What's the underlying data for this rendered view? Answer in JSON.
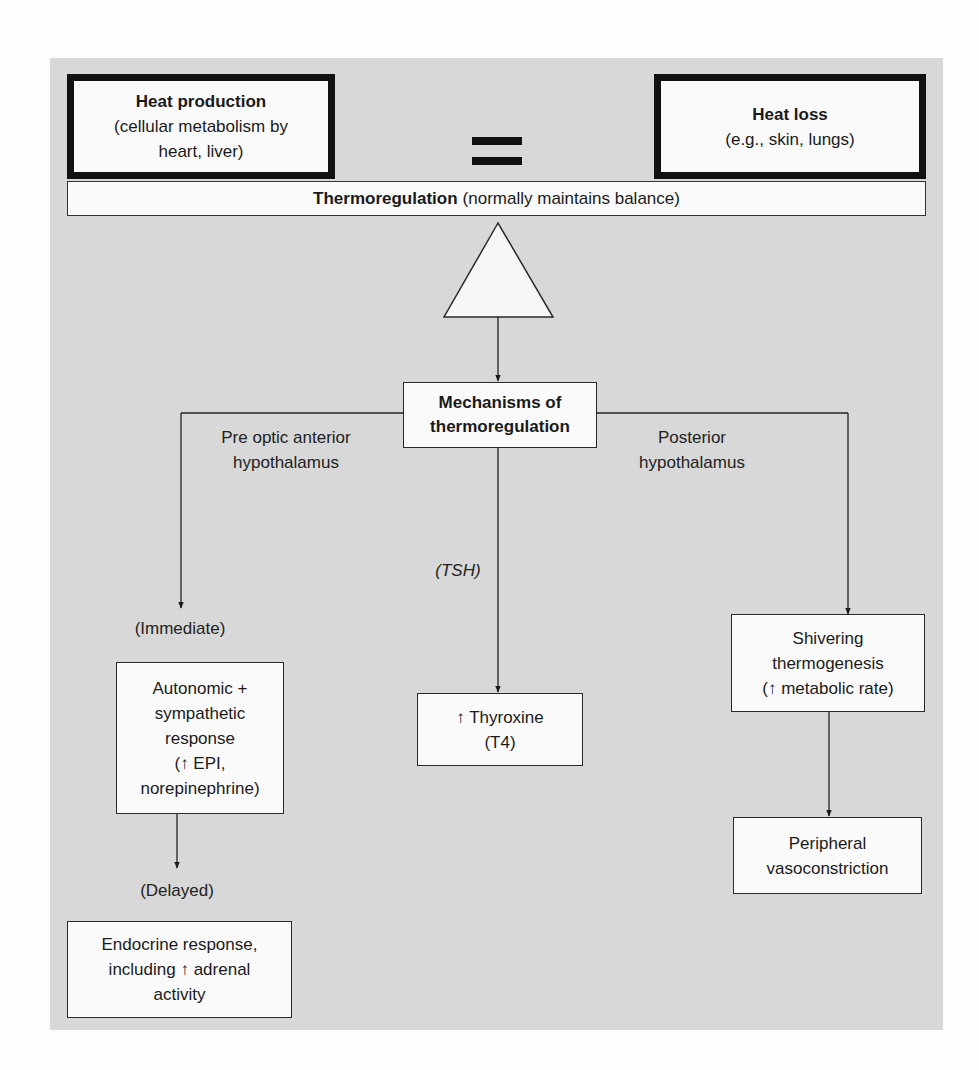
{
  "diagram": {
    "colors": {
      "panel_background": "#d8d8d8",
      "box_fill": "#fafafa",
      "line": "#222222"
    },
    "heat_production": {
      "title": "Heat production",
      "detail_line1": "(cellular metabolism by",
      "detail_line2": "heart, liver)"
    },
    "equals_symbol": "=",
    "heat_loss": {
      "title": "Heat loss",
      "detail": "(e.g., skin, lungs)"
    },
    "thermoregulation_bar": {
      "title": "Thermoregulation",
      "detail": "(normally maintains balance)"
    },
    "fulcrum": "triangle-fulcrum",
    "mechanisms": {
      "line1": "Mechanisms of",
      "line2": "thermoregulation"
    },
    "branches": {
      "left": {
        "label_line1": "Pre optic anterior",
        "label_line2": "hypothalamus",
        "timing_immediate": "(Immediate)",
        "autonomic_box": {
          "line1": "Autonomic +",
          "line2": "sympathetic",
          "line3": "response",
          "line4": "(↑ EPI,",
          "line5": "norepinephrine)"
        },
        "timing_delayed": "(Delayed)",
        "endocrine_box": {
          "line1": "Endocrine response,",
          "line2": "including ↑ adrenal",
          "line3": "activity"
        }
      },
      "center": {
        "label": "(TSH)",
        "thyroxine_box": {
          "line1": "↑ Thyroxine",
          "line2": "(T4)"
        }
      },
      "right": {
        "label_line1": "Posterior",
        "label_line2": "hypothalamus",
        "shivering_box": {
          "line1": "Shivering",
          "line2": "thermogenesis",
          "line3": "(↑ metabolic rate)"
        },
        "peripheral_box": {
          "line1": "Peripheral",
          "line2": "vasoconstriction"
        }
      }
    }
  }
}
